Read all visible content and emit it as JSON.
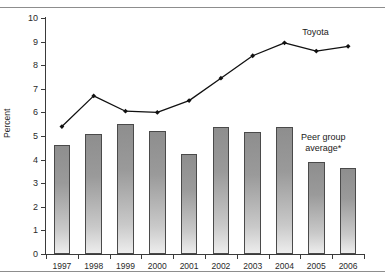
{
  "chart_data": {
    "type": "bar",
    "title": "",
    "subtitle": "",
    "xlabel": "",
    "ylabel": "Percent",
    "ylim": [
      0,
      10
    ],
    "ytick_step": 1,
    "grid": false,
    "legend_position": "inline-annotation",
    "categories": [
      "1997",
      "1998",
      "1999",
      "2000",
      "2001",
      "2002",
      "2003",
      "2004",
      "2005",
      "2006"
    ],
    "series": [
      {
        "name": "Peer group average*",
        "type": "bar",
        "values": [
          4.6,
          5.1,
          5.5,
          5.2,
          4.25,
          5.4,
          5.15,
          5.4,
          3.9,
          3.65
        ]
      },
      {
        "name": "Toyota",
        "type": "line",
        "values": [
          5.4,
          6.7,
          6.05,
          6.0,
          6.5,
          7.45,
          8.4,
          8.95,
          8.6,
          8.8
        ]
      }
    ],
    "annotations": [
      {
        "text": "Toyota",
        "anchor": "series-toyota",
        "x": "2005",
        "y": 9.35
      },
      {
        "text": "Peer group\naverage*",
        "anchor": "series-peer-group",
        "x": "2005",
        "y": 4.9
      }
    ],
    "ytick_labels": [
      "0",
      "1",
      "2",
      "3",
      "4",
      "5",
      "6",
      "7",
      "8",
      "9",
      "10"
    ],
    "colors": {
      "bar_top": "#8e8e8e",
      "bar_bottom": "#ededed",
      "bar_edge": "#4a4a4a",
      "line": "#111111",
      "marker": "#111111",
      "axis": "#3a3a3a",
      "rule": "#8d8d8d",
      "text": "#1a1a1a",
      "background": "#ffffff"
    }
  },
  "annotations": {
    "toyota_label": "Toyota",
    "peer_label_line1": "Peer group",
    "peer_label_line2": "average*"
  }
}
